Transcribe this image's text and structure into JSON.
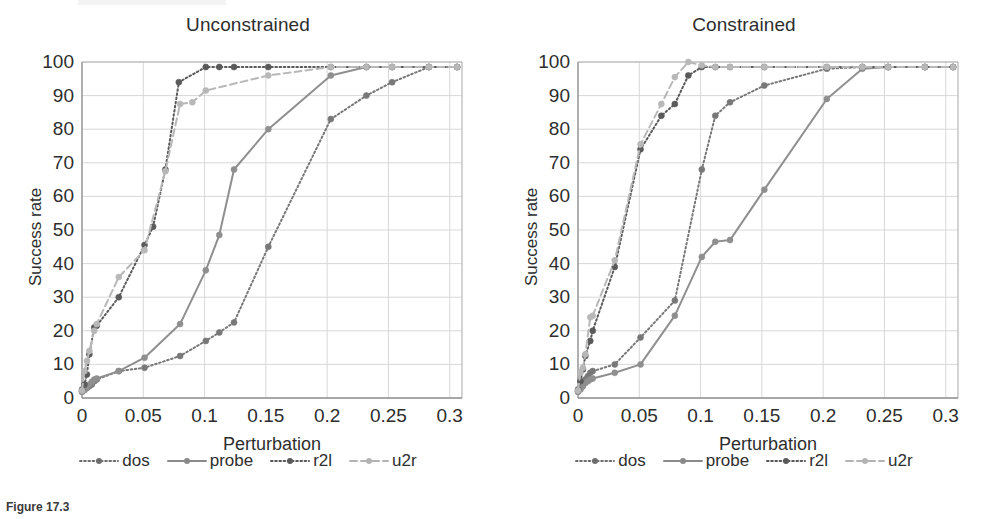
{
  "figure": {
    "caption_prefix": "Figure 17.3",
    "caption_rest": "Success rate"
  },
  "axes": {
    "ylabel": "Success rate",
    "xlabel": "Perturbation",
    "yticks": [
      "0",
      "10",
      "20",
      "30",
      "40",
      "50",
      "60",
      "70",
      "80",
      "90",
      "100"
    ],
    "xticks": [
      "0",
      "0.05",
      "0.1",
      "0.15",
      "0.2",
      "0.25",
      "0.3"
    ],
    "ylim": [
      0,
      100
    ],
    "xlim": [
      0,
      0.31
    ]
  },
  "legend": {
    "position": "below-axes",
    "items": [
      {
        "label": "dos",
        "key": "dotted-marker-line",
        "color": "#6e6e6e",
        "style": "dotted"
      },
      {
        "label": "probe",
        "key": "solid-marker-line",
        "color": "#8a8a8a",
        "style": "solid"
      },
      {
        "label": "r2l",
        "key": "dotted-marker-line",
        "color": "#595959",
        "style": "dotted"
      },
      {
        "label": "u2r",
        "key": "dashed-marker-line",
        "color": "#b4b4b4",
        "style": "dashed"
      }
    ]
  },
  "colors": {
    "dos": "#787878",
    "probe": "#8f8f8f",
    "r2l": "#5a5a5a",
    "u2r": "#b8b8b8",
    "grid": "#d8d8d8",
    "frame": "#b0b0b0",
    "text": "#2e2e2e"
  },
  "chart_data": [
    {
      "type": "line",
      "title": "Unconstrained",
      "xlabel": "Perturbation",
      "ylabel": "Success rate",
      "xlim": [
        0,
        0.31
      ],
      "ylim": [
        0,
        100
      ],
      "grid": true,
      "legend_position": "bottom",
      "series": [
        {
          "name": "dos",
          "style": "dotted",
          "color": "#787878",
          "points": [
            [
              0.0,
              2.0
            ],
            [
              0.002,
              2.5
            ],
            [
              0.004,
              3.0
            ],
            [
              0.006,
              3.5
            ],
            [
              0.008,
              4.0
            ],
            [
              0.01,
              5.0
            ],
            [
              0.012,
              5.5
            ],
            [
              0.03,
              8.0
            ],
            [
              0.051,
              9.0
            ],
            [
              0.08,
              12.5
            ],
            [
              0.101,
              17.0
            ],
            [
              0.112,
              19.5
            ],
            [
              0.124,
              22.5
            ],
            [
              0.152,
              45.0
            ],
            [
              0.203,
              83.0
            ],
            [
              0.232,
              90.0
            ],
            [
              0.253,
              94.0
            ],
            [
              0.283,
              98.5
            ],
            [
              0.306,
              98.5
            ]
          ]
        },
        {
          "name": "probe",
          "style": "solid",
          "color": "#8f8f8f",
          "points": [
            [
              0.0,
              1.8
            ],
            [
              0.002,
              2.3
            ],
            [
              0.004,
              3.2
            ],
            [
              0.006,
              4.0
            ],
            [
              0.008,
              4.8
            ],
            [
              0.01,
              5.5
            ],
            [
              0.012,
              5.8
            ],
            [
              0.03,
              8.0
            ],
            [
              0.051,
              12.0
            ],
            [
              0.08,
              22.0
            ],
            [
              0.101,
              38.0
            ],
            [
              0.112,
              48.5
            ],
            [
              0.124,
              68.0
            ],
            [
              0.152,
              80.0
            ],
            [
              0.203,
              96.0
            ],
            [
              0.232,
              98.5
            ],
            [
              0.253,
              98.5
            ],
            [
              0.283,
              98.5
            ],
            [
              0.306,
              98.5
            ]
          ]
        },
        {
          "name": "r2l",
          "style": "dotted",
          "color": "#5a5a5a",
          "points": [
            [
              0.0,
              2.5
            ],
            [
              0.002,
              4.0
            ],
            [
              0.004,
              7.0
            ],
            [
              0.006,
              13.0
            ],
            [
              0.01,
              21.0
            ],
            [
              0.012,
              21.5
            ],
            [
              0.03,
              30.0
            ],
            [
              0.051,
              45.5
            ],
            [
              0.058,
              51.0
            ],
            [
              0.068,
              68.0
            ],
            [
              0.079,
              94.0
            ],
            [
              0.101,
              98.5
            ],
            [
              0.112,
              98.5
            ],
            [
              0.124,
              98.5
            ],
            [
              0.152,
              98.5
            ],
            [
              0.203,
              98.5
            ],
            [
              0.232,
              98.5
            ],
            [
              0.253,
              98.5
            ],
            [
              0.283,
              98.5
            ],
            [
              0.306,
              98.5
            ]
          ]
        },
        {
          "name": "u2r",
          "style": "dashed",
          "color": "#b8b8b8",
          "points": [
            [
              0.0,
              2.2
            ],
            [
              0.002,
              8.0
            ],
            [
              0.004,
              11.0
            ],
            [
              0.006,
              14.0
            ],
            [
              0.01,
              20.0
            ],
            [
              0.012,
              22.0
            ],
            [
              0.03,
              36.0
            ],
            [
              0.051,
              44.0
            ],
            [
              0.068,
              67.5
            ],
            [
              0.08,
              87.5
            ],
            [
              0.09,
              88.0
            ],
            [
              0.101,
              91.5
            ],
            [
              0.152,
              96.0
            ],
            [
              0.203,
              98.5
            ],
            [
              0.232,
              98.5
            ],
            [
              0.253,
              98.5
            ],
            [
              0.283,
              98.5
            ],
            [
              0.306,
              98.5
            ]
          ]
        }
      ]
    },
    {
      "type": "line",
      "title": "Constrained",
      "xlabel": "Perturbation",
      "ylabel": "Success rate",
      "xlim": [
        0,
        0.31
      ],
      "ylim": [
        0,
        100
      ],
      "grid": true,
      "legend_position": "bottom",
      "series": [
        {
          "name": "dos",
          "style": "dotted",
          "color": "#787878",
          "points": [
            [
              0.0,
              2.0
            ],
            [
              0.002,
              3.0
            ],
            [
              0.004,
              4.0
            ],
            [
              0.006,
              5.5
            ],
            [
              0.008,
              6.5
            ],
            [
              0.01,
              7.5
            ],
            [
              0.012,
              8.0
            ],
            [
              0.03,
              10.0
            ],
            [
              0.051,
              18.0
            ],
            [
              0.079,
              29.0
            ],
            [
              0.101,
              68.0
            ],
            [
              0.112,
              84.0
            ],
            [
              0.124,
              88.0
            ],
            [
              0.152,
              93.0
            ],
            [
              0.203,
              98.0
            ],
            [
              0.232,
              98.5
            ],
            [
              0.253,
              98.5
            ],
            [
              0.283,
              98.5
            ],
            [
              0.306,
              98.5
            ]
          ]
        },
        {
          "name": "probe",
          "style": "solid",
          "color": "#8f8f8f",
          "points": [
            [
              0.0,
              1.8
            ],
            [
              0.002,
              2.5
            ],
            [
              0.004,
              3.5
            ],
            [
              0.006,
              4.5
            ],
            [
              0.008,
              5.0
            ],
            [
              0.01,
              5.5
            ],
            [
              0.012,
              5.8
            ],
            [
              0.03,
              7.5
            ],
            [
              0.051,
              10.0
            ],
            [
              0.079,
              24.5
            ],
            [
              0.101,
              42.0
            ],
            [
              0.112,
              46.5
            ],
            [
              0.124,
              47.0
            ],
            [
              0.152,
              62.0
            ],
            [
              0.203,
              89.0
            ],
            [
              0.232,
              98.0
            ],
            [
              0.253,
              98.5
            ],
            [
              0.283,
              98.5
            ],
            [
              0.306,
              98.5
            ]
          ]
        },
        {
          "name": "r2l",
          "style": "dotted",
          "color": "#5a5a5a",
          "points": [
            [
              0.0,
              2.5
            ],
            [
              0.002,
              5.0
            ],
            [
              0.004,
              8.5
            ],
            [
              0.006,
              12.5
            ],
            [
              0.01,
              17.0
            ],
            [
              0.012,
              20.0
            ],
            [
              0.03,
              39.0
            ],
            [
              0.051,
              74.0
            ],
            [
              0.068,
              84.0
            ],
            [
              0.079,
              87.5
            ],
            [
              0.09,
              96.0
            ],
            [
              0.101,
              98.5
            ],
            [
              0.112,
              98.5
            ],
            [
              0.124,
              98.5
            ],
            [
              0.152,
              98.5
            ],
            [
              0.203,
              98.5
            ],
            [
              0.232,
              98.5
            ],
            [
              0.253,
              98.5
            ],
            [
              0.283,
              98.5
            ],
            [
              0.306,
              98.5
            ]
          ]
        },
        {
          "name": "u2r",
          "style": "dashed",
          "color": "#b8b8b8",
          "points": [
            [
              0.0,
              2.2
            ],
            [
              0.002,
              7.5
            ],
            [
              0.004,
              9.0
            ],
            [
              0.006,
              13.0
            ],
            [
              0.01,
              24.0
            ],
            [
              0.012,
              24.5
            ],
            [
              0.03,
              41.0
            ],
            [
              0.051,
              75.5
            ],
            [
              0.068,
              87.5
            ],
            [
              0.079,
              95.5
            ],
            [
              0.09,
              100.0
            ],
            [
              0.101,
              99.0
            ],
            [
              0.112,
              98.5
            ],
            [
              0.124,
              98.5
            ],
            [
              0.152,
              98.5
            ],
            [
              0.203,
              98.5
            ],
            [
              0.232,
              98.5
            ],
            [
              0.253,
              98.5
            ],
            [
              0.283,
              98.5
            ],
            [
              0.306,
              98.5
            ]
          ]
        }
      ]
    }
  ]
}
